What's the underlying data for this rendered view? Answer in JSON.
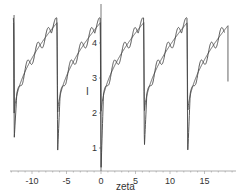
{
  "chart_data": {
    "type": "line",
    "title": "",
    "xlabel": "zeta",
    "ylabel": "I",
    "xlim": [
      -13,
      18.5
    ],
    "ylim": [
      0.35,
      5.2
    ],
    "x_ticks": [
      "-10",
      "-5",
      "0",
      "5",
      "10",
      "15"
    ],
    "y_ticks": [
      "1",
      "2",
      "3",
      "4"
    ],
    "x_axis_crosses_y_at": 0.35,
    "y_axis_crosses_x_at": 0,
    "grid": false,
    "legend": null,
    "period": 6.283,
    "series": [
      {
        "name": "smooth",
        "description": "periodic sawtooth-like curve rising from ~2 to ~4.6 then dropping sharply at multiples of 2π",
        "x": [
          -12.6,
          -12.3,
          -11.5,
          -10.5,
          -9.5,
          -8.5,
          -7.5,
          -6.7,
          -6.3,
          -6.0,
          -5.2,
          -4.2,
          -3.2,
          -2.2,
          -1.2,
          -0.4,
          0,
          0.3,
          1.1,
          2.1,
          3.1,
          4.1,
          5.1,
          5.9,
          6.3,
          6.6,
          7.4,
          8.4,
          9.4,
          10.4,
          11.4,
          12.2,
          12.6,
          12.9,
          13.7,
          14.7,
          15.7,
          16.7,
          17.7,
          18.5
        ],
        "values": [
          4.8,
          2.0,
          2.8,
          3.3,
          3.7,
          4.0,
          4.3,
          4.5,
          4.6,
          2.0,
          2.8,
          3.3,
          3.7,
          4.0,
          4.3,
          4.5,
          4.6,
          2.0,
          2.8,
          3.3,
          3.7,
          4.0,
          4.3,
          4.5,
          4.6,
          2.0,
          2.8,
          3.3,
          3.7,
          4.0,
          4.3,
          4.5,
          4.6,
          2.0,
          2.8,
          3.3,
          3.7,
          4.0,
          4.3,
          2.9
        ]
      },
      {
        "name": "oscillating",
        "description": "same trend with small superimposed oscillations, deeper minima near each drop and a peak ~4.9 before each drop",
        "minima": [
          {
            "x": -12.6,
            "y": 1.3
          },
          {
            "x": -6.3,
            "y": 0.9
          },
          {
            "x": 0,
            "y": 0.35
          },
          {
            "x": 6.3,
            "y": 1.0
          },
          {
            "x": 12.6,
            "y": 0.8
          }
        ],
        "peaks": [
          {
            "x": -7.2,
            "y": 4.9
          },
          {
            "x": -0.9,
            "y": 4.9
          },
          {
            "x": 5.4,
            "y": 4.9
          },
          {
            "x": 11.7,
            "y": 4.9
          },
          {
            "x": 17.2,
            "y": 4.9
          }
        ]
      }
    ]
  },
  "axes": {
    "x_label": "zeta",
    "y_label": "I"
  }
}
